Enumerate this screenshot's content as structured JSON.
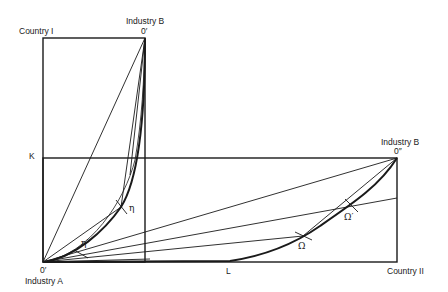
{
  "diagram": {
    "colors": {
      "stroke": "#1a1a1a",
      "background": "#ffffff"
    },
    "labels": {
      "country_1": "Country I",
      "country_2": "Country II",
      "industry_b_top": "Industry B",
      "origin_top": "0′",
      "industry_b_right": "Industry B",
      "origin_right": "0″",
      "origin_bottom": "0′",
      "industry_a": "Industry A",
      "capital_axis": "K",
      "labor_axis": "L",
      "eta": "η",
      "eta_prime": "η′",
      "omega": "Ω",
      "omega_prime": "Ω′"
    },
    "geometry": {
      "origin_industry_a": [
        43,
        262
      ],
      "origin_industry_b_country_1": [
        145,
        38
      ],
      "origin_industry_b_country_2": [
        397,
        158
      ],
      "country_1_box": {
        "x1": 43,
        "y1": 38,
        "x2": 145,
        "y2": 262
      },
      "country_2_box": {
        "x1": 43,
        "y1": 158,
        "x2": 397,
        "y2": 262
      },
      "points": {
        "eta": [
          121,
          207
        ],
        "eta_prime": [
          81,
          254
        ],
        "omega": [
          303,
          236
        ],
        "omega_prime": [
          351,
          205
        ]
      }
    }
  }
}
